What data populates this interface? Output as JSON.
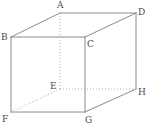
{
  "figure": {
    "name": "cube-diagram",
    "type": "geometric-solid",
    "shape": "cube",
    "background_color": "#ffffff",
    "solid_edge_color": "#8c8c8c",
    "hidden_edge_color": "#b0b0b0",
    "label_color": "#4a4a4a",
    "stroke_width": 1,
    "hidden_dash_pattern": "1,2",
    "width": 147,
    "height": 130
  },
  "vertices": [
    {
      "id": "A",
      "label": "A",
      "x": 60,
      "y": 13,
      "label_x": 57,
      "label_y": 1,
      "hidden": false
    },
    {
      "id": "B",
      "label": "B",
      "x": 11,
      "y": 37,
      "label_x": 1,
      "label_y": 33,
      "hidden": false
    },
    {
      "id": "C",
      "label": "C",
      "x": 85,
      "y": 37,
      "label_x": 87,
      "label_y": 40,
      "hidden": false
    },
    {
      "id": "D",
      "label": "D",
      "x": 136,
      "y": 13,
      "label_x": 138,
      "label_y": 8,
      "hidden": false
    },
    {
      "id": "E",
      "label": "E",
      "x": 60,
      "y": 89,
      "label_x": 50,
      "label_y": 82,
      "hidden": true
    },
    {
      "id": "F",
      "label": "F",
      "x": 11,
      "y": 112,
      "label_x": 2,
      "label_y": 115,
      "hidden": false
    },
    {
      "id": "G",
      "label": "G",
      "x": 85,
      "y": 112,
      "label_x": 85,
      "label_y": 116,
      "hidden": false
    },
    {
      "id": "H",
      "label": "H",
      "x": 136,
      "y": 89,
      "label_x": 138,
      "label_y": 88,
      "hidden": false
    }
  ],
  "edges": [
    {
      "from": "A",
      "to": "D",
      "style": "solid",
      "name": "edge-A-D"
    },
    {
      "from": "A",
      "to": "B",
      "style": "solid",
      "name": "edge-A-B"
    },
    {
      "from": "B",
      "to": "C",
      "style": "solid",
      "name": "edge-B-C"
    },
    {
      "from": "C",
      "to": "D",
      "style": "solid",
      "name": "edge-C-D"
    },
    {
      "from": "B",
      "to": "F",
      "style": "solid",
      "name": "edge-B-F"
    },
    {
      "from": "C",
      "to": "G",
      "style": "solid",
      "name": "edge-C-G"
    },
    {
      "from": "D",
      "to": "H",
      "style": "solid",
      "name": "edge-D-H"
    },
    {
      "from": "F",
      "to": "G",
      "style": "solid",
      "name": "edge-F-G"
    },
    {
      "from": "G",
      "to": "H",
      "style": "solid",
      "name": "edge-G-H"
    },
    {
      "from": "A",
      "to": "E",
      "style": "dotted",
      "name": "edge-A-E"
    },
    {
      "from": "E",
      "to": "F",
      "style": "dotted",
      "name": "edge-E-F"
    },
    {
      "from": "E",
      "to": "H",
      "style": "dotted",
      "name": "edge-E-H"
    }
  ]
}
